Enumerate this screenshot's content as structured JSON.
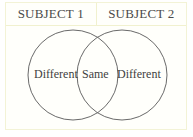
{
  "header": {
    "subject1": "SUBJECT 1",
    "subject2": "SUBJECT 2"
  },
  "venn": {
    "left_label": "Different",
    "center_label": "Same",
    "right_label": "Different",
    "circle_stroke": "#6a6a6a"
  },
  "colors": {
    "border": "#f1f1cf",
    "background": "#fffffb"
  }
}
